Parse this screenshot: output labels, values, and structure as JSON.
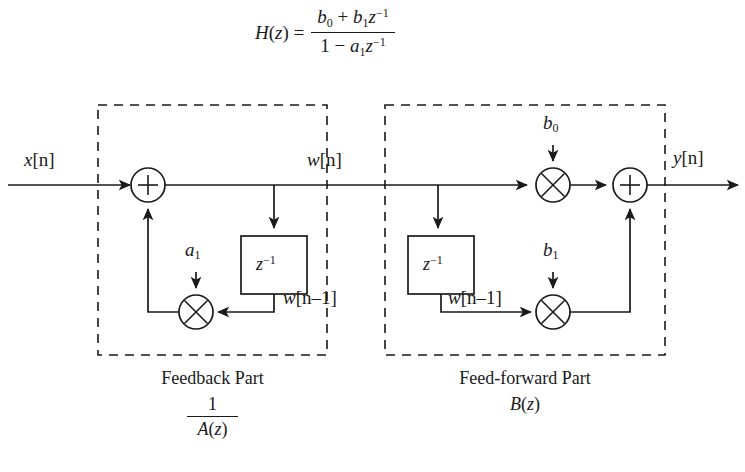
{
  "figure": {
    "type": "direct-form-II IIR filter signal flow graph",
    "transfer_function": {
      "lhs": "H(z) =",
      "numerator": "b0 + b1 z^-1",
      "denominator": "1 - a1 z^-1",
      "num_parts": {
        "b0": "b",
        "b0_sub": "0",
        "b1": "b",
        "b1_sub": "1",
        "z": "z",
        "z_sup": "-1",
        "plus": "+"
      },
      "den_parts": {
        "one": "1",
        "minus": "–",
        "a1": "a",
        "a1_sub": "1",
        "z": "z",
        "z_sup": "-1"
      }
    },
    "signals": {
      "input": {
        "name": "x",
        "index": "[n]"
      },
      "intermediate": {
        "name": "w",
        "index": "[n]"
      },
      "delayed_left": {
        "name": "w",
        "index": "[n–1]"
      },
      "delayed_right": {
        "name": "w",
        "index": "[n–1]"
      },
      "output": {
        "name": "y",
        "index": "[n]"
      }
    },
    "coefficients": {
      "a1": {
        "symbol": "a",
        "sub": "1"
      },
      "b0": {
        "symbol": "b",
        "sub": "0"
      },
      "b1": {
        "symbol": "b",
        "sub": "1"
      }
    },
    "delay_blocks": {
      "left_label": "z",
      "left_sup": "-1",
      "right_label": "z",
      "right_sup": "-1"
    },
    "operators": {
      "adder": "+",
      "multiplier": "×"
    },
    "sections": [
      {
        "id": "feedback",
        "title": "Feedback Part",
        "formula_type": "fraction",
        "numerator": "1",
        "denominator": "A(z)",
        "denominator_parts": {
          "A": "A",
          "paren_open": "(",
          "z": "z",
          "paren_close": ")"
        }
      },
      {
        "id": "feed-forward",
        "title": "Feed-forward Part",
        "formula_type": "plain",
        "formula": "B(z)",
        "formula_parts": {
          "B": "B",
          "paren_open": "(",
          "z": "z",
          "paren_close": ")"
        }
      }
    ],
    "colors": {
      "stroke": "#1a1a1a",
      "background": "#ffffff",
      "dashed_border": "#1a1a1a"
    }
  }
}
